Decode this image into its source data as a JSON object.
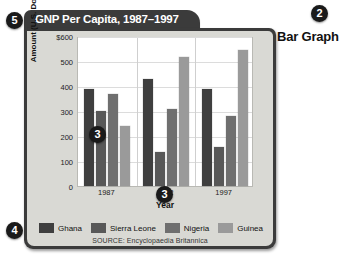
{
  "callouts": {
    "badge_5": "5",
    "badge_4": "4",
    "badge_3_left": "3",
    "badge_3_bottom": "3",
    "badge_2": "2"
  },
  "caption": "Bar Graph",
  "card": {
    "tab_title": "GNP Per Capita, 1987–1997"
  },
  "source": "SOURCE: Encyclopaedia Britannica",
  "colors": {
    "ghana": "#3f3f3f",
    "sierra_leone": "#585858",
    "nigeria": "#6f6f6f",
    "guinea": "#9a9a9a",
    "card": "#3b3b3b",
    "panel": "#d9d9d4",
    "plot_bg": "#ffffff"
  },
  "chart_data": {
    "type": "bar",
    "title": "GNP Per Capita, 1987–1997",
    "xlabel": "Year",
    "ylabel": "Amount (U.S. Dollars)",
    "categories": [
      "1987",
      "1992",
      "1997"
    ],
    "ylim": [
      0,
      600
    ],
    "yticks": [
      0,
      100,
      200,
      300,
      400,
      500,
      600
    ],
    "ytick_labels": [
      "0",
      "100",
      "200",
      "300",
      "400",
      "500",
      "$600"
    ],
    "grid": true,
    "legend_position": "bottom",
    "series": [
      {
        "name": "Ghana",
        "color": "#3f3f3f",
        "values": [
          390,
          430,
          390
        ]
      },
      {
        "name": "Sierra Leone",
        "color": "#585858",
        "values": [
          300,
          135,
          155
        ]
      },
      {
        "name": "Nigeria",
        "color": "#6f6f6f",
        "values": [
          370,
          310,
          280
        ]
      },
      {
        "name": "Guinea",
        "color": "#9a9a9a",
        "values": [
          240,
          515,
          545
        ]
      }
    ],
    "source": "SOURCE: Encyclopaedia Britannica"
  }
}
